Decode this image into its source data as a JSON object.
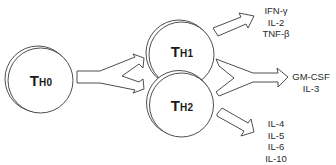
{
  "diagram": {
    "type": "T helper cell differentiation",
    "colors": {
      "stroke": "#3a3a3a",
      "fill": "#ffffff",
      "text": "#1a1a1a"
    },
    "cells": [
      {
        "id": "th0",
        "main": "T",
        "sub": "H0"
      },
      {
        "id": "th1",
        "main": "T",
        "sub": "H1"
      },
      {
        "id": "th2",
        "main": "T",
        "sub": "H2"
      }
    ],
    "outputs": {
      "th1": [
        "IFN-γ",
        "IL-2",
        "TNF-β"
      ],
      "shared": [
        "GM-CSF",
        "IL-3"
      ],
      "th2": [
        "IL-4",
        "IL-5",
        "IL-6",
        "IL-10"
      ]
    },
    "edges": [
      {
        "from": "th0",
        "to": [
          "th1",
          "th2"
        ],
        "shape": "forked-arrow"
      },
      {
        "from": "th1",
        "to": "th1-cytokines",
        "shape": "arrow"
      },
      {
        "from": [
          "th1",
          "th2"
        ],
        "to": "shared-cytokines",
        "shape": "merging-arrow"
      },
      {
        "from": "th2",
        "to": "th2-cytokines",
        "shape": "arrow"
      }
    ]
  }
}
